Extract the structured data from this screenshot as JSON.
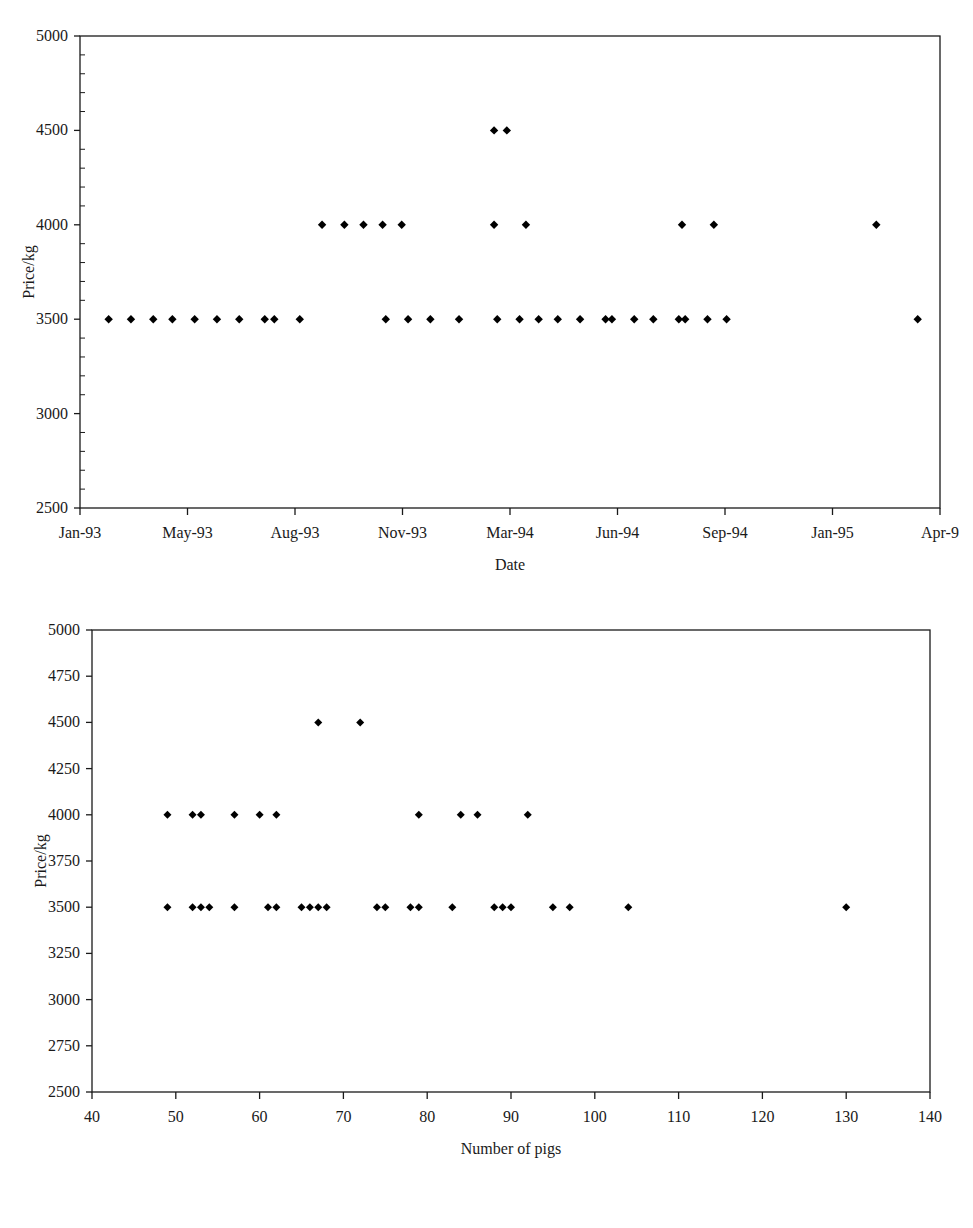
{
  "page": {
    "background_color": "#ffffff",
    "ink_color": "#1a1a1a",
    "marker_color": "#000000"
  },
  "charts": [
    {
      "id": "price-vs-date",
      "title": "",
      "xlabel": "Date",
      "ylabel": "Price/kg"
    },
    {
      "id": "price-vs-number-of-pigs",
      "title": "",
      "xlabel": "Number of pigs",
      "ylabel": "Price/kg"
    }
  ],
  "chart_data": [
    {
      "type": "scatter",
      "title": "",
      "xlabel": "Date",
      "ylabel": "Price/kg",
      "grid": false,
      "legend": null,
      "marker": "diamond",
      "marker_color": "#000000",
      "ylim": [
        2500,
        5000
      ],
      "yticks": [
        2500,
        3000,
        3500,
        4000,
        4500,
        5000
      ],
      "ytick_labels": [
        "2500",
        "3000",
        "3500",
        "4000",
        "4500",
        "5000"
      ],
      "xtick_labels": [
        "Jan-93",
        "May-93",
        "Aug-93",
        "Nov-93",
        "Mar-94",
        "Jun-94",
        "Sep-94",
        "Jan-95",
        "Apr-9"
      ],
      "xtick_note": "last tick label clipped by image edge (Apr-95)",
      "xlim_months": [
        0,
        27
      ],
      "points": [
        {
          "x": 0.9,
          "y": 3500
        },
        {
          "x": 1.6,
          "y": 3500
        },
        {
          "x": 2.3,
          "y": 3500
        },
        {
          "x": 2.9,
          "y": 3500
        },
        {
          "x": 3.6,
          "y": 3500
        },
        {
          "x": 4.3,
          "y": 3500
        },
        {
          "x": 5.0,
          "y": 3500
        },
        {
          "x": 5.8,
          "y": 3500
        },
        {
          "x": 6.1,
          "y": 3500
        },
        {
          "x": 6.9,
          "y": 3500
        },
        {
          "x": 7.6,
          "y": 4000
        },
        {
          "x": 8.3,
          "y": 4000
        },
        {
          "x": 8.9,
          "y": 4000
        },
        {
          "x": 9.5,
          "y": 4000
        },
        {
          "x": 10.1,
          "y": 4000
        },
        {
          "x": 9.6,
          "y": 3500
        },
        {
          "x": 10.3,
          "y": 3500
        },
        {
          "x": 11.0,
          "y": 3500
        },
        {
          "x": 11.9,
          "y": 3500
        },
        {
          "x": 13.0,
          "y": 4500
        },
        {
          "x": 13.4,
          "y": 4500
        },
        {
          "x": 13.0,
          "y": 4000
        },
        {
          "x": 14.0,
          "y": 4000
        },
        {
          "x": 13.1,
          "y": 3500
        },
        {
          "x": 13.8,
          "y": 3500
        },
        {
          "x": 14.4,
          "y": 3500
        },
        {
          "x": 15.0,
          "y": 3500
        },
        {
          "x": 15.7,
          "y": 3500
        },
        {
          "x": 16.5,
          "y": 3500
        },
        {
          "x": 16.7,
          "y": 3500
        },
        {
          "x": 17.4,
          "y": 3500
        },
        {
          "x": 18.0,
          "y": 3500
        },
        {
          "x": 18.8,
          "y": 3500
        },
        {
          "x": 19.0,
          "y": 3500
        },
        {
          "x": 19.7,
          "y": 3500
        },
        {
          "x": 20.3,
          "y": 3500
        },
        {
          "x": 18.9,
          "y": 4000
        },
        {
          "x": 19.9,
          "y": 4000
        },
        {
          "x": 25.0,
          "y": 4000
        },
        {
          "x": 26.3,
          "y": 3500
        }
      ]
    },
    {
      "type": "scatter",
      "title": "",
      "xlabel": "Number of pigs",
      "ylabel": "Price/kg",
      "grid": false,
      "legend": null,
      "marker": "diamond",
      "marker_color": "#000000",
      "xlim": [
        40,
        140
      ],
      "ylim": [
        2500,
        5000
      ],
      "xticks": [
        40,
        50,
        60,
        70,
        80,
        90,
        100,
        110,
        120,
        130,
        140
      ],
      "xtick_labels": [
        "40",
        "50",
        "60",
        "70",
        "80",
        "90",
        "100",
        "110",
        "120",
        "130",
        "140"
      ],
      "yticks": [
        2500,
        2750,
        3000,
        3250,
        3500,
        3750,
        4000,
        4250,
        4500,
        4750,
        5000
      ],
      "ytick_labels": [
        "2500",
        "2750",
        "3000",
        "3250",
        "3500",
        "3750",
        "4000",
        "4250",
        "4500",
        "4750",
        "5000"
      ],
      "points": [
        {
          "x": 67,
          "y": 4500
        },
        {
          "x": 72,
          "y": 4500
        },
        {
          "x": 49,
          "y": 4000
        },
        {
          "x": 52,
          "y": 4000
        },
        {
          "x": 53,
          "y": 4000
        },
        {
          "x": 57,
          "y": 4000
        },
        {
          "x": 60,
          "y": 4000
        },
        {
          "x": 62,
          "y": 4000
        },
        {
          "x": 79,
          "y": 4000
        },
        {
          "x": 84,
          "y": 4000
        },
        {
          "x": 86,
          "y": 4000
        },
        {
          "x": 92,
          "y": 4000
        },
        {
          "x": 49,
          "y": 3500
        },
        {
          "x": 52,
          "y": 3500
        },
        {
          "x": 53,
          "y": 3500
        },
        {
          "x": 54,
          "y": 3500
        },
        {
          "x": 57,
          "y": 3500
        },
        {
          "x": 61,
          "y": 3500
        },
        {
          "x": 62,
          "y": 3500
        },
        {
          "x": 65,
          "y": 3500
        },
        {
          "x": 66,
          "y": 3500
        },
        {
          "x": 67,
          "y": 3500
        },
        {
          "x": 68,
          "y": 3500
        },
        {
          "x": 74,
          "y": 3500
        },
        {
          "x": 75,
          "y": 3500
        },
        {
          "x": 78,
          "y": 3500
        },
        {
          "x": 79,
          "y": 3500
        },
        {
          "x": 83,
          "y": 3500
        },
        {
          "x": 88,
          "y": 3500
        },
        {
          "x": 89,
          "y": 3500
        },
        {
          "x": 90,
          "y": 3500
        },
        {
          "x": 95,
          "y": 3500
        },
        {
          "x": 97,
          "y": 3500
        },
        {
          "x": 104,
          "y": 3500
        },
        {
          "x": 130,
          "y": 3500
        }
      ]
    }
  ]
}
